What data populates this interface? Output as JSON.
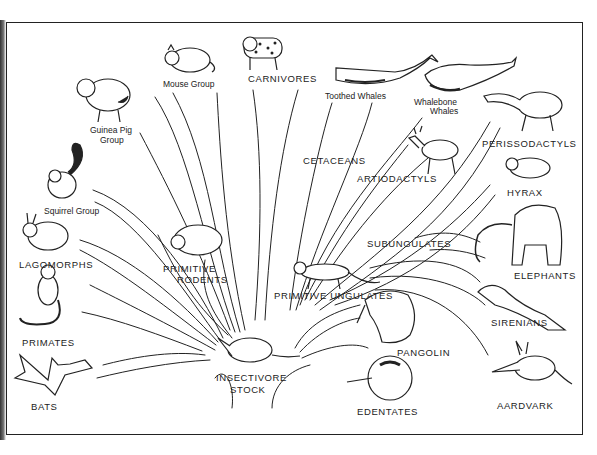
{
  "diagram": {
    "root": {
      "label_line1": "INSECTIVORE",
      "label_line2": "STOCK"
    },
    "groups": {
      "mouse": "Mouse Group",
      "carnivores": "CARNIVORES",
      "toothed_whales": "Toothed Whales",
      "whalebone_whales_line1": "Whalebone",
      "whalebone_whales_line2": "Whales",
      "guinea_pig_line1": "Guinea Pig",
      "guinea_pig_line2": "Group",
      "cetaceans": "CETACEANS",
      "perissodactyls": "PERISSODACTYLS",
      "artiodactyls": "ARTIODACTYLS",
      "hyrax": "HYRAX",
      "squirrel": "Squirrel Group",
      "primitive_rodents_line1": "PRIMITIVE",
      "primitive_rodents_line2": "RODENTS",
      "subungulates": "SUBUNGULATES",
      "lagomorphs": "LAGOMORPHS",
      "elephants": "ELEPHANTS",
      "primitive_ungulates": "PRIMITIVE UNGULATES",
      "primates": "PRIMATES",
      "sirenians": "SIRENIANS",
      "pangolin": "PANGOLIN",
      "bats": "BATS",
      "edentates": "EDENTATES",
      "aardvark": "AARDVARK"
    },
    "colors": {
      "ink": "#222222",
      "paper": "#ffffff"
    }
  }
}
